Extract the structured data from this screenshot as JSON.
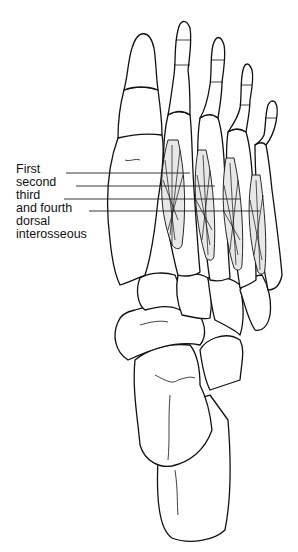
{
  "figure": {
    "labels": [
      {
        "text": "First",
        "top": 163
      },
      {
        "text": "second",
        "top": 176
      },
      {
        "text": "third",
        "top": 189
      },
      {
        "text": "and fourth",
        "top": 202
      },
      {
        "text": "dorsal",
        "top": 215
      },
      {
        "text": "interosseous",
        "top": 228
      }
    ],
    "leader_lines": [
      {
        "x1": 66,
        "y1": 173,
        "x2": 190
      },
      {
        "x1": 76,
        "y1": 186,
        "x2": 215
      },
      {
        "x1": 64,
        "y1": 199,
        "x2": 240
      },
      {
        "x1": 89,
        "y1": 211,
        "x2": 260
      }
    ],
    "colors": {
      "line": "#111111",
      "background": "#ffffff"
    }
  }
}
